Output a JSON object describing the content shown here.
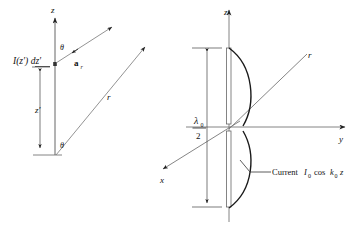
{
  "figure": {
    "background_color": "#ffffff",
    "line_color": "#555555",
    "text_color": "#111111",
    "width": 362,
    "height": 235
  },
  "left_diagram": {
    "name": "differential-current-element-geometry",
    "axis_z_label": "z",
    "current_element_label": "I(z′) dz′",
    "height_label": "z′",
    "angle_upper_label": "θ",
    "angle_lower_label": "θ",
    "unit_vector_label": "a",
    "unit_vector_sub": "r",
    "range_label": "r"
  },
  "right_diagram": {
    "name": "half-wave-dipole-current-distribution",
    "axis_z_label": "z",
    "axis_y_label": "y",
    "axis_x_label": "x",
    "axis_r_label": "r",
    "length_numerator": "λ",
    "length_numerator_sub": "0",
    "length_denominator": "2",
    "current_label_text": "Current",
    "current_symbol": "I",
    "current_symbol_sub": "0",
    "current_cos": "cos",
    "current_k": "k",
    "current_k_sub": "0",
    "current_var": "z"
  }
}
